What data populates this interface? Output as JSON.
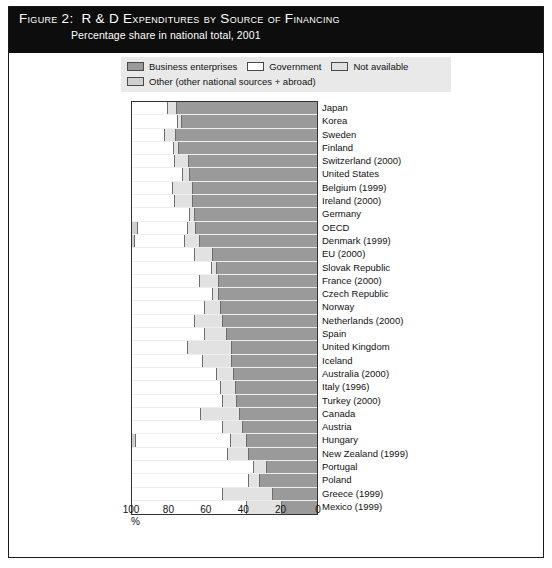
{
  "figure": {
    "label": "Figure 2:",
    "title": "R & D Expenditures by Source of Financing",
    "subtitle": "Percentage share in national total, 2001"
  },
  "legend": {
    "items": [
      {
        "label": "Business enterprises",
        "color": "#9a9a9a",
        "key": "business"
      },
      {
        "label": "Government",
        "color": "#ffffff",
        "key": "government"
      },
      {
        "label": "Not available",
        "color": "#e2e2e2",
        "key": "not_available"
      },
      {
        "label": "Other (other national sources + abroad)",
        "color": "#cfcfcf",
        "key": "other"
      }
    ]
  },
  "axis": {
    "unit": "%",
    "ticks": [
      {
        "value": 100,
        "label": "100"
      },
      {
        "value": 80,
        "label": "80"
      },
      {
        "value": 60,
        "label": "60"
      },
      {
        "value": 40,
        "label": "40"
      },
      {
        "value": 20,
        "label": "20"
      },
      {
        "value": 0,
        "label": "0"
      }
    ]
  },
  "chart_data": {
    "type": "bar",
    "orientation": "horizontal-stacked",
    "title": "R & D Expenditures by Source of Financing",
    "subtitle": "Percentage share in national total, 2001",
    "xlabel": "%",
    "ylabel": "",
    "xlim": [
      100,
      0
    ],
    "x_axis_reversed": true,
    "grid": false,
    "legend_position": "top",
    "stack_order_left_to_right": [
      "other",
      "government",
      "not_available",
      "business"
    ],
    "series": [
      {
        "name": "Business enterprises",
        "key": "business",
        "color": "#9a9a9a"
      },
      {
        "name": "Government",
        "key": "government",
        "color": "#ffffff"
      },
      {
        "name": "Not available",
        "key": "not_available",
        "color": "#e2e2e2"
      },
      {
        "name": "Other (other national sources + abroad)",
        "key": "other",
        "color": "#cfcfcf"
      }
    ],
    "categories": [
      "Japan",
      "Korea",
      "Sweden",
      "Finland",
      "Switzerland (2000)",
      "United States",
      "Belgium (1999)",
      "Ireland (2000)",
      "Germany",
      "OECD",
      "Denmark (1999)",
      "EU (2000)",
      "Slovak Republic",
      "France (2000)",
      "Czech Republic",
      "Norway",
      "Netherlands (2000)",
      "Spain",
      "United Kingdom",
      "Iceland",
      "Australia (2000)",
      "Italy (1996)",
      "Turkey (2000)",
      "Canada",
      "Austria",
      "Hungary",
      "New Zealand (1999)",
      "Portugal",
      "Poland",
      "Greece (1999)",
      "Mexico (1999)"
    ],
    "rows": [
      {
        "category": "Japan",
        "other": 0,
        "government": 19.5,
        "not_available": 5.0,
        "business": 75.5
      },
      {
        "category": "Korea",
        "other": 0,
        "government": 25.0,
        "not_available": 2.0,
        "business": 73.0
      },
      {
        "category": "Sweden",
        "other": 0,
        "government": 18.0,
        "not_available": 6.0,
        "business": 76.0
      },
      {
        "category": "Finland",
        "other": 0,
        "government": 22.5,
        "not_available": 3.0,
        "business": 74.5
      },
      {
        "category": "Switzerland (2000)",
        "other": 0,
        "government": 23.0,
        "not_available": 8.0,
        "business": 69.0
      },
      {
        "category": "United States",
        "other": 0,
        "government": 27.5,
        "not_available": 4.0,
        "business": 68.5
      },
      {
        "category": "Belgium (1999)",
        "other": 0,
        "government": 22.0,
        "not_available": 11.0,
        "business": 67.0
      },
      {
        "category": "Ireland (2000)",
        "other": 0,
        "government": 23.0,
        "not_available": 10.0,
        "business": 67.0
      },
      {
        "category": "Germany",
        "other": 0,
        "government": 31.5,
        "not_available": 2.5,
        "business": 66.0
      },
      {
        "category": "OECD",
        "other": 3.5,
        "government": 27.0,
        "not_available": 4.0,
        "business": 65.5
      },
      {
        "category": "Denmark (1999)",
        "other": 1.5,
        "government": 27.0,
        "not_available": 8.5,
        "business": 63.0
      },
      {
        "category": "EU (2000)",
        "other": 0,
        "government": 34.0,
        "not_available": 10.0,
        "business": 56.0
      },
      {
        "category": "Slovak Republic",
        "other": 0,
        "government": 43.0,
        "not_available": 3.0,
        "business": 54.0
      },
      {
        "category": "France (2000)",
        "other": 0,
        "government": 36.5,
        "not_available": 10.5,
        "business": 53.0
      },
      {
        "category": "Czech Republic",
        "other": 0,
        "government": 44.0,
        "not_available": 3.0,
        "business": 53.0
      },
      {
        "category": "Norway",
        "other": 0,
        "government": 39.5,
        "not_available": 8.5,
        "business": 52.0
      },
      {
        "category": "Netherlands (2000)",
        "other": 0,
        "government": 34.0,
        "not_available": 15.0,
        "business": 51.0
      },
      {
        "category": "Spain",
        "other": 0,
        "government": 39.5,
        "not_available": 12.0,
        "business": 48.5
      },
      {
        "category": "United Kingdom",
        "other": 0,
        "government": 30.0,
        "not_available": 24.0,
        "business": 46.0
      },
      {
        "category": "Iceland",
        "other": 0,
        "government": 38.5,
        "not_available": 15.5,
        "business": 46.0
      },
      {
        "category": "Australia (2000)",
        "other": 0,
        "government": 46.0,
        "not_available": 9.0,
        "business": 45.0
      },
      {
        "category": "Italy (1996)",
        "other": 0,
        "government": 48.0,
        "not_available": 8.0,
        "business": 44.0
      },
      {
        "category": "Turkey (2000)",
        "other": 0,
        "government": 49.0,
        "not_available": 8.0,
        "business": 43.0
      },
      {
        "category": "Canada",
        "other": 0,
        "government": 37.5,
        "not_available": 21.0,
        "business": 41.5
      },
      {
        "category": "Austria",
        "other": 0,
        "government": 49.0,
        "not_available": 11.0,
        "business": 40.0
      },
      {
        "category": "Hungary",
        "other": 2.0,
        "government": 51.5,
        "not_available": 8.5,
        "business": 38.0
      },
      {
        "category": "New Zealand (1999)",
        "other": 0,
        "government": 52.0,
        "not_available": 11.0,
        "business": 37.0
      },
      {
        "category": "Portugal",
        "other": 0,
        "government": 66.0,
        "not_available": 7.0,
        "business": 27.0
      },
      {
        "category": "Poland",
        "other": 0,
        "government": 63.0,
        "not_available": 6.0,
        "business": 31.0
      },
      {
        "category": "Greece (1999)",
        "other": 0,
        "government": 49.0,
        "not_available": 27.0,
        "business": 24.0
      },
      {
        "category": "Mexico (1999)",
        "other": 0,
        "government": 62.0,
        "not_available": 19.0,
        "business": 19.0
      }
    ]
  }
}
